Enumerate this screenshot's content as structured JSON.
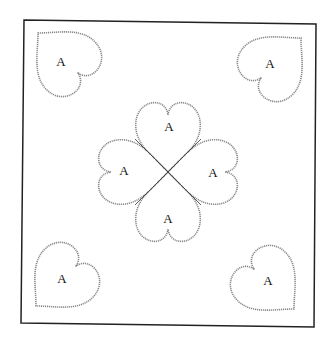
{
  "diagram": {
    "type": "appliqué quilt block pattern",
    "frame": {
      "stroke": "#222222"
    },
    "piece_label": "A",
    "corner_hearts": [
      {
        "position": "top-left",
        "label": "A"
      },
      {
        "position": "top-right",
        "label": "A"
      },
      {
        "position": "bottom-left",
        "label": "A"
      },
      {
        "position": "bottom-right",
        "label": "A"
      }
    ],
    "center_clover": {
      "hearts": [
        {
          "position": "top",
          "label": "A"
        },
        {
          "position": "left",
          "label": "A"
        },
        {
          "position": "right",
          "label": "A"
        },
        {
          "position": "bottom",
          "label": "A"
        }
      ]
    }
  }
}
